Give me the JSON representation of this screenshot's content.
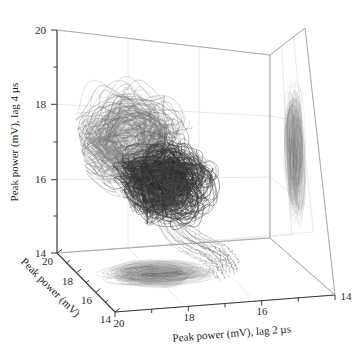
{
  "figure": {
    "background": "#ffffff",
    "width": 363,
    "height": 359
  },
  "chart_data": {
    "type": "line",
    "subtype": "3d-phase-space-attractor",
    "title": "",
    "xlabel": "Peak power (mV), lag 2 µs",
    "ylabel": "Peak power (mV), lag 4 µs",
    "zlabel": "Peak power (mV)",
    "xlim": [
      20,
      14
    ],
    "ylim": [
      14,
      20
    ],
    "zlim": [
      20,
      14
    ],
    "xticks": [
      20,
      18,
      16,
      14
    ],
    "yticks": [
      14,
      16,
      18,
      20
    ],
    "zticks": [
      20,
      18,
      16,
      14
    ],
    "xticklabels": [
      "20",
      "18",
      "16",
      "14"
    ],
    "yticklabels": [
      "14",
      "16",
      "18",
      "20"
    ],
    "zticklabels": [
      "20",
      "18",
      "16",
      "14"
    ],
    "grid": true,
    "legend": false,
    "legend_position": "none",
    "projections": [
      "floor-xz-plane",
      "right-wall-yz-plane"
    ],
    "series": [
      {
        "name": "attractor-trajectory",
        "color": "#4a4a4a",
        "description": "Dense chaotic orbit of peak power delay embedding, centered near (18, 16.8, 17.5), spanning roughly x 16.5-19.5, y 15-18.8, z 15-19",
        "center": [
          18.0,
          16.8,
          17.5
        ],
        "x_range": [
          16.4,
          19.6
        ],
        "y_range": [
          14.8,
          18.9
        ],
        "z_range": [
          15.0,
          19.0
        ]
      },
      {
        "name": "floor-projection",
        "color": "#6e6e6e",
        "description": "Flattened elliptical spiral projected on the bottom x-z plane",
        "center": [
          18.0,
          14.0,
          17.4
        ],
        "x_range": [
          16.6,
          19.4
        ],
        "z_range": [
          15.6,
          19.2
        ]
      },
      {
        "name": "right-wall-projection",
        "color": "#808080",
        "description": "Vertically elongated spiral blob projected on the right y-z wall",
        "center": [
          14.0,
          16.9,
          17.4
        ],
        "y_range": [
          15.0,
          18.7
        ],
        "z_range": [
          15.8,
          18.8
        ]
      }
    ],
    "annotations": []
  },
  "axes": {
    "x": {
      "label": "Peak power (mV), lag 2 µs",
      "ticks": [
        "20",
        "18",
        "16",
        "14"
      ]
    },
    "y": {
      "label": "Peak power (mV), lag 4 µs",
      "ticks": [
        "14",
        "16",
        "18",
        "20"
      ]
    },
    "z": {
      "label": "Peak power (mV)",
      "ticks": [
        "20",
        "18",
        "16",
        "14"
      ]
    }
  },
  "colors": {
    "axis_line": "#3a3a3a",
    "grid_line": "#d8d8d8",
    "pane_edge": "#bdbdbd",
    "trace_dark": "#3f3f3f",
    "trace_mid": "#6a6a6a",
    "trace_light": "#9a9a9a",
    "text": "#1c1c1c"
  }
}
